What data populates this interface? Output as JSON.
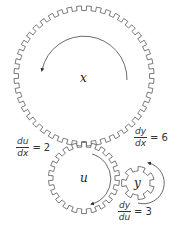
{
  "diagram": {
    "colors": {
      "stroke": "#555555",
      "background": "#ffffff",
      "text": "#222222"
    },
    "gears": [
      {
        "id": "x",
        "label": "x",
        "cx": 84,
        "cy": 76,
        "r_outer": 70,
        "r_inner": 65.5,
        "teeth": 44
      },
      {
        "id": "u",
        "label": "u",
        "cx": 84,
        "cy": 178,
        "r_outer": 35.5,
        "r_inner": 31,
        "teeth": 22
      },
      {
        "id": "y",
        "label": "y",
        "cx": 138,
        "cy": 183,
        "r_outer": 16.5,
        "r_inner": 12,
        "teeth": 7
      }
    ],
    "rates": [
      {
        "id": "du_dx",
        "num": "du",
        "den": "dx",
        "eq": "=",
        "value": "2"
      },
      {
        "id": "dy_dx",
        "num": "dy",
        "den": "dx",
        "eq": "=",
        "value": "6"
      },
      {
        "id": "dy_du",
        "num": "dy",
        "den": "du",
        "eq": "=",
        "value": "3"
      }
    ]
  }
}
